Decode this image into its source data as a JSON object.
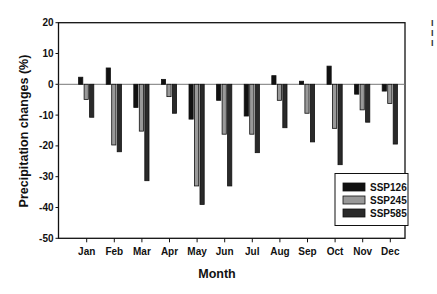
{
  "chart_data": {
    "type": "bar",
    "title": "",
    "xlabel": "Month",
    "ylabel": "Precipitation changes (%)",
    "ylim": [
      -50,
      20
    ],
    "yticks": [
      20,
      10,
      0,
      -10,
      -20,
      -30,
      -40,
      -50
    ],
    "grid": false,
    "legend_position": "lower right (inside plot)",
    "categories": [
      "Jan",
      "Feb",
      "Mar",
      "Apr",
      "May",
      "Jun",
      "Jul",
      "Aug",
      "Sep",
      "Oct",
      "Nov",
      "Dec"
    ],
    "series": [
      {
        "name": "SSP126",
        "color": "#111111",
        "values": [
          2.3,
          5.3,
          -7.5,
          1.6,
          -11.3,
          -5.2,
          -10.3,
          2.8,
          1.0,
          5.9,
          -3.2,
          -2.2
        ]
      },
      {
        "name": "SSP245",
        "color": "#999999",
        "values": [
          -4.9,
          -19.7,
          -15.2,
          -4.0,
          -33.0,
          -16.2,
          -16.2,
          -5.2,
          -9.4,
          -14.3,
          -8.3,
          -6.2
        ]
      },
      {
        "name": "SSP585",
        "color": "#2a2a2a",
        "values": [
          -10.7,
          -21.9,
          -31.3,
          -9.4,
          -39.0,
          -33.0,
          -22.2,
          -14.1,
          -18.7,
          -26.1,
          -12.3,
          -19.4
        ]
      }
    ]
  },
  "right_edge_glyphs": [
    "I",
    "I",
    "I"
  ]
}
